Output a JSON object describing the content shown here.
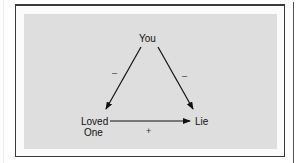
{
  "diagram": {
    "type": "balance-triangle",
    "nodes": {
      "top": "You",
      "bottom_left_line1": "Loved",
      "bottom_left_line2": "One",
      "bottom_right": "Lie"
    },
    "edges": [
      {
        "from": "You",
        "to": "Loved One",
        "sign": "–"
      },
      {
        "from": "You",
        "to": "Lie",
        "sign": "–"
      },
      {
        "from": "Loved One",
        "to": "Lie",
        "sign": "+"
      }
    ],
    "colors": {
      "panel": "#dedede",
      "frame_border": "#3a3a3a",
      "ink": "#111111"
    }
  }
}
